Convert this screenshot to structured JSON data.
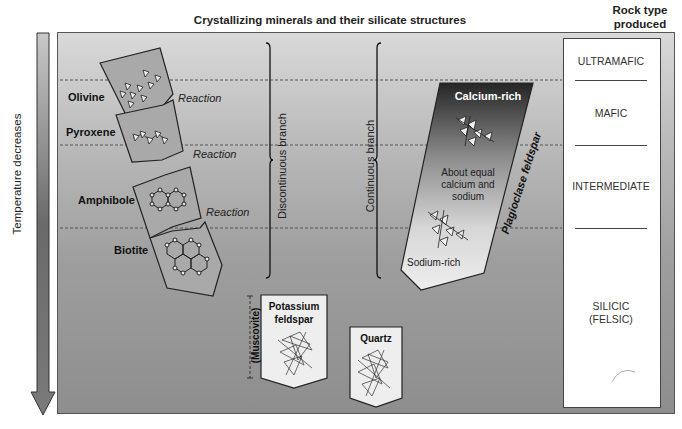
{
  "header": {
    "title": "Crystallizing minerals and their silicate structures",
    "rock_type_title_line1": "Rock type",
    "rock_type_title_line2": "produced"
  },
  "temperature_axis": {
    "label": "Temperature decreases",
    "direction": "down"
  },
  "discontinuous_branch": {
    "label": "Discontinuous branch",
    "minerals": [
      {
        "name": "Olivine",
        "structure": "isolated tetrahedra"
      },
      {
        "name": "Pyroxene",
        "structure": "single chain"
      },
      {
        "name": "Amphibole",
        "structure": "double chain"
      },
      {
        "name": "Biotite",
        "structure": "sheet"
      }
    ],
    "reaction_labels": [
      "Reaction",
      "Reaction",
      "Reaction"
    ]
  },
  "continuous_branch": {
    "label": "Continuous branch",
    "mineral": "Plagioclase feldspar",
    "top_label": "Calcium-rich",
    "middle_label_line1": "About equal",
    "middle_label_line2": "calcium and",
    "middle_label_line3": "sodium",
    "bottom_label": "Sodium-rich"
  },
  "late_minerals": {
    "muscovite": "(Muscovite)",
    "potassium_feldspar_line1": "Potassium",
    "potassium_feldspar_line2": "feldspar",
    "quartz": "Quartz"
  },
  "rock_types": [
    {
      "label": "ULTRAMAFIC"
    },
    {
      "label": "MAFIC"
    },
    {
      "label": "INTERMEDIATE"
    },
    {
      "label_line1": "SILICIC",
      "label_line2": "(FELSIC)"
    }
  ],
  "colors": {
    "panel_top": "#d9d9d9",
    "panel_bottom": "#8e8e8e",
    "mineral_fill": "#a8a8a8",
    "plagioclase_top": "#2a2a2a",
    "plagioclase_bottom": "#e8e8e8",
    "white_box": "#ffffff"
  }
}
